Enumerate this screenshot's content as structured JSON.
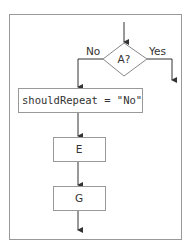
{
  "diagram": {
    "type": "flowchart",
    "decision": {
      "label": "A?",
      "no_label": "No",
      "yes_label": "Yes"
    },
    "boxes": [
      {
        "id": "assign",
        "label": "shouldRepeat = \"No\""
      },
      {
        "id": "E",
        "label": "E"
      },
      {
        "id": "G",
        "label": "G"
      }
    ],
    "colors": {
      "stroke": "#555555",
      "frame": "#999999",
      "text": "#333333"
    }
  }
}
